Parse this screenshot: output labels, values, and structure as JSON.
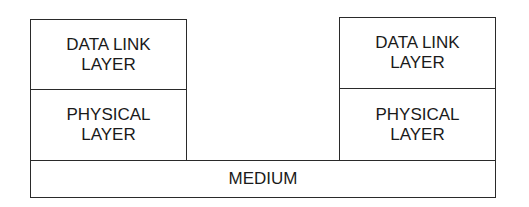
{
  "diagram": {
    "left_stack": {
      "data_link": "DATA LINK\nLAYER",
      "physical": "PHYSICAL\nLAYER"
    },
    "right_stack": {
      "data_link": "DATA LINK\nLAYER",
      "physical": "PHYSICAL\nLAYER"
    },
    "medium": "MEDIUM"
  }
}
